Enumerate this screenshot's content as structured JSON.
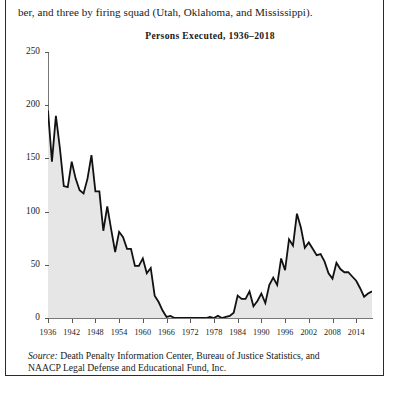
{
  "page": {
    "body_text": "ber, and three by firing squad (Utah, Oklahoma, and Mississippi).",
    "source_lead": "Source:",
    "source_line1": " Death Penalty Information Center, Bureau of Justice Statistics, and",
    "source_line2": "NAACP Legal Defense and Educational Fund, Inc.",
    "frame_color": "#2b2b2b"
  },
  "chart_data": {
    "type": "area",
    "title": "Persons Executed, 1936–2018",
    "xlabel": "",
    "ylabel": "",
    "ylim": [
      0,
      250
    ],
    "xlim": [
      1936,
      2018
    ],
    "grid": false,
    "legend": "none",
    "yticks": [
      0,
      50,
      100,
      150,
      200,
      250
    ],
    "ytick_labels": [
      "0",
      "50",
      "100",
      "150",
      "200",
      "250"
    ],
    "xticks": [
      1936,
      1942,
      1948,
      1954,
      1960,
      1966,
      1972,
      1978,
      1984,
      1990,
      1996,
      2002,
      2008,
      2014
    ],
    "xtick_labels": [
      "1936",
      "1942",
      "1948",
      "1954",
      "1960",
      "1966",
      "1972",
      "1978",
      "1984",
      "1990",
      "1996",
      "2002",
      "2008",
      "2014"
    ],
    "line_color": "#111111",
    "fill_color": "#e6e6e6",
    "series": [
      {
        "name": "Persons Executed",
        "x": [
          1936,
          1937,
          1938,
          1939,
          1940,
          1941,
          1942,
          1943,
          1944,
          1945,
          1946,
          1947,
          1948,
          1949,
          1950,
          1951,
          1952,
          1953,
          1954,
          1955,
          1956,
          1957,
          1958,
          1959,
          1960,
          1961,
          1962,
          1963,
          1964,
          1965,
          1966,
          1967,
          1968,
          1969,
          1970,
          1971,
          1972,
          1973,
          1974,
          1975,
          1976,
          1977,
          1978,
          1979,
          1980,
          1981,
          1982,
          1983,
          1984,
          1985,
          1986,
          1987,
          1988,
          1989,
          1990,
          1991,
          1992,
          1993,
          1994,
          1995,
          1996,
          1997,
          1998,
          1999,
          2000,
          2001,
          2002,
          2003,
          2004,
          2005,
          2006,
          2007,
          2008,
          2009,
          2010,
          2011,
          2012,
          2013,
          2014,
          2015,
          2016,
          2017,
          2018
        ],
        "values": [
          195,
          147,
          190,
          160,
          124,
          123,
          147,
          131,
          120,
          117,
          131,
          153,
          119,
          119,
          82,
          105,
          83,
          62,
          81,
          76,
          65,
          65,
          49,
          49,
          56,
          42,
          47,
          21,
          15,
          7,
          1,
          2,
          0,
          0,
          0,
          0,
          0,
          0,
          0,
          0,
          0,
          1,
          0,
          2,
          0,
          1,
          2,
          5,
          21,
          18,
          18,
          25,
          11,
          16,
          23,
          14,
          31,
          38,
          31,
          56,
          45,
          74,
          68,
          98,
          85,
          66,
          71,
          65,
          59,
          60,
          53,
          42,
          37,
          52,
          46,
          43,
          43,
          39,
          35,
          28,
          20,
          23,
          25
        ]
      }
    ]
  }
}
